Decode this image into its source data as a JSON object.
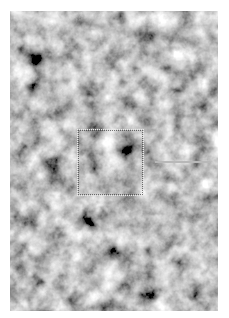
{
  "image": {
    "description": "grayscale cloudy noise texture",
    "frame": {
      "left": 10,
      "top": 11,
      "width": 208,
      "height": 300
    },
    "colors": {
      "background": "#ffffff",
      "noise_dark": "#111111",
      "noise_light": "#e6e6e6"
    }
  },
  "selection": {
    "left": 67,
    "top": 118,
    "width": 67,
    "height": 67,
    "style": "dotted"
  },
  "line": {
    "left": 145,
    "top": 150,
    "width": 55,
    "color": "#b8b8b8"
  }
}
